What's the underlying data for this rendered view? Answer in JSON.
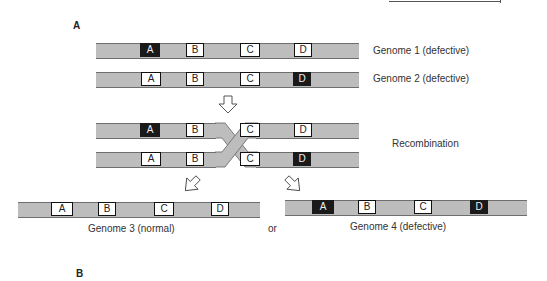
{
  "panels": {
    "a_label": "A",
    "b_label": "B"
  },
  "genomes": {
    "genome1": {
      "label": "Genome 1 (defective)",
      "genes": [
        {
          "name": "A",
          "state": "defective"
        },
        {
          "name": "B",
          "state": "normal"
        },
        {
          "name": "C",
          "state": "normal"
        },
        {
          "name": "D",
          "state": "normal"
        }
      ]
    },
    "genome2": {
      "label": "Genome 2 (defective)",
      "genes": [
        {
          "name": "A",
          "state": "normal"
        },
        {
          "name": "B",
          "state": "normal"
        },
        {
          "name": "C",
          "state": "normal"
        },
        {
          "name": "D",
          "state": "defective"
        }
      ]
    },
    "recombination": {
      "label": "Recombination",
      "top": [
        {
          "name": "A",
          "state": "defective"
        },
        {
          "name": "B",
          "state": "normal"
        },
        {
          "name": "C",
          "state": "normal"
        },
        {
          "name": "D",
          "state": "normal"
        }
      ],
      "bottom": [
        {
          "name": "A",
          "state": "normal"
        },
        {
          "name": "B",
          "state": "normal"
        },
        {
          "name": "C",
          "state": "normal"
        },
        {
          "name": "D",
          "state": "defective"
        }
      ]
    },
    "genome3": {
      "label": "Genome 3 (normal)",
      "genes": [
        {
          "name": "A",
          "state": "normal"
        },
        {
          "name": "B",
          "state": "normal"
        },
        {
          "name": "C",
          "state": "normal"
        },
        {
          "name": "D",
          "state": "normal"
        }
      ]
    },
    "genome4": {
      "label": "Genome 4 (defective)",
      "genes": [
        {
          "name": "A",
          "state": "defective"
        },
        {
          "name": "B",
          "state": "normal"
        },
        {
          "name": "C",
          "state": "normal"
        },
        {
          "name": "D",
          "state": "defective"
        }
      ]
    },
    "connector": "or"
  },
  "colors": {
    "chromosome": "#bdbdbd",
    "defective_gene": "#1a1a1a",
    "normal_gene": "#ffffff"
  }
}
